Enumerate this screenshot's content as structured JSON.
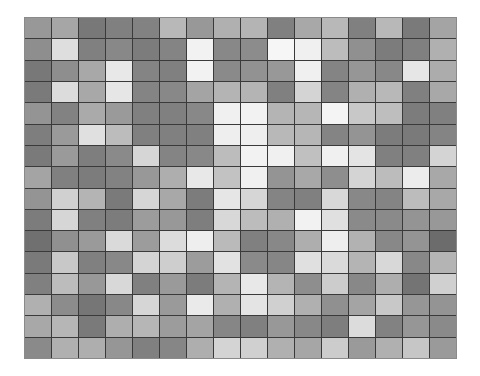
{
  "image": {
    "description": "grid of grayscale square tiles",
    "rows": 16,
    "cols": 16,
    "background": "#ffffff",
    "grout_color": "#3a3a3a",
    "tiles": [
      [
        "#989898",
        "#a6a6a6",
        "#787878",
        "#808080",
        "#828282",
        "#b8b8b8",
        "#989898",
        "#b0b0b0",
        "#b4b4b4",
        "#808080",
        "#a8a8a8",
        "#b8b8b8",
        "#808080",
        "#b8b8b8",
        "#7a7a7a",
        "#a4a4a4"
      ],
      [
        "#8e8e8e",
        "#dedede",
        "#808080",
        "#888888",
        "#7c7c7c",
        "#848484",
        "#f2f2f2",
        "#888888",
        "#8c8c8c",
        "#f6f6f6",
        "#f0f0f0",
        "#bcbcbc",
        "#909090",
        "#7c7c7c",
        "#808080",
        "#b0b0b0"
      ],
      [
        "#787878",
        "#8e8e8e",
        "#a8a8a8",
        "#e8e8e8",
        "#848484",
        "#808080",
        "#f2f2f2",
        "#8a8a8a",
        "#929292",
        "#989898",
        "#f0f0f0",
        "#848484",
        "#969696",
        "#888888",
        "#e6e6e6",
        "#acacac"
      ],
      [
        "#7a7a7a",
        "#dcdcdc",
        "#a8a8a8",
        "#e6e6e6",
        "#848484",
        "#888888",
        "#a4a4a4",
        "#b4b4b4",
        "#b4b4b4",
        "#808080",
        "#d4d4d4",
        "#848484",
        "#b0b0b0",
        "#b8b8b8",
        "#808080",
        "#a8a8a8"
      ],
      [
        "#949494",
        "#828282",
        "#aaaaaa",
        "#9a9a9a",
        "#808080",
        "#808080",
        "#888888",
        "#f0f0f0",
        "#f2f2f2",
        "#b4b4b4",
        "#b6b6b6",
        "#f4f4f4",
        "#c8c8c8",
        "#bebebe",
        "#7c7c7c",
        "#808080"
      ],
      [
        "#7e7e7e",
        "#9a9a9a",
        "#e0e0e0",
        "#bcbcbc",
        "#808080",
        "#808080",
        "#808080",
        "#eeeeee",
        "#eeeeee",
        "#b8b8b8",
        "#b6b6b6",
        "#848484",
        "#949494",
        "#7c7c7c",
        "#7a7a7a",
        "#848484"
      ],
      [
        "#7a7a7a",
        "#9a9a9a",
        "#7e7e7e",
        "#8a8a8a",
        "#d6d6d6",
        "#848484",
        "#888888",
        "#bcbcbc",
        "#f2f2f2",
        "#f0f0f0",
        "#c0c0c0",
        "#f0f0f0",
        "#e4e4e4",
        "#808080",
        "#808080",
        "#d4d4d4"
      ],
      [
        "#a4a4a4",
        "#808080",
        "#7c7c7c",
        "#828282",
        "#989898",
        "#aeaeae",
        "#e8e8e8",
        "#c2c2c2",
        "#f0f0f0",
        "#949494",
        "#a8a8a8",
        "#8e8e8e",
        "#d4d4d4",
        "#bcbcbc",
        "#ececec",
        "#a8a8a8"
      ],
      [
        "#949494",
        "#d0d0d0",
        "#b4b4b4",
        "#7a7a7a",
        "#d6d6d6",
        "#a8a8a8",
        "#7c7c7c",
        "#e6e6e6",
        "#d6d6d6",
        "#848484",
        "#808080",
        "#d8d8d8",
        "#888888",
        "#848484",
        "#bcbcbc",
        "#a8a8a8"
      ],
      [
        "#7c7c7c",
        "#d6d6d6",
        "#808080",
        "#7c7c7c",
        "#9c9c9c",
        "#989898",
        "#7e7e7e",
        "#d8d8d8",
        "#bcbcbc",
        "#b0b0b0",
        "#f2f2f2",
        "#e0e0e0",
        "#8a8a8a",
        "#8a8a8a",
        "#949494",
        "#989898"
      ],
      [
        "#707070",
        "#909090",
        "#9a9a9a",
        "#dadada",
        "#9c9c9c",
        "#dcdcdc",
        "#eeeeee",
        "#bababa",
        "#808080",
        "#888888",
        "#aeaeae",
        "#eeeeee",
        "#b2b2b2",
        "#888888",
        "#949494",
        "#6c6c6c"
      ],
      [
        "#7a7a7a",
        "#c8c8c8",
        "#808080",
        "#888888",
        "#d4d4d4",
        "#cecece",
        "#9c9c9c",
        "#e2e2e2",
        "#8a8a8a",
        "#868686",
        "#e0e0e0",
        "#dadada",
        "#b4b4b4",
        "#d8d8d8",
        "#888888",
        "#b4b4b4"
      ],
      [
        "#808080",
        "#bcbcbc",
        "#989898",
        "#d8d8d8",
        "#808080",
        "#9a9a9a",
        "#7c7c7c",
        "#b4b4b4",
        "#e8e8e8",
        "#b4b4b4",
        "#8e8e8e",
        "#cccccc",
        "#888888",
        "#aeaeae",
        "#747474",
        "#d0d0d0"
      ],
      [
        "#b0b0b0",
        "#8c8c8c",
        "#767676",
        "#888888",
        "#d6d6d6",
        "#9a9a9a",
        "#eaeaea",
        "#b0b0b0",
        "#e4e4e4",
        "#d0d0d0",
        "#b0b0b0",
        "#909090",
        "#a4a4a4",
        "#c8c8c8",
        "#969696",
        "#949494"
      ],
      [
        "#a8a8a8",
        "#b6b6b6",
        "#7a7a7a",
        "#aeaeae",
        "#b6b6b6",
        "#9c9c9c",
        "#a4a4a4",
        "#868686",
        "#808080",
        "#989898",
        "#888888",
        "#7e7e7e",
        "#dcdcdc",
        "#828282",
        "#969696",
        "#8a8a8a"
      ],
      [
        "#8a8a8a",
        "#b0b0b0",
        "#aeaeae",
        "#969696",
        "#808080",
        "#868686",
        "#aeaeae",
        "#d4d4d4",
        "#d0d0d0",
        "#b0b0b0",
        "#a6a6a6",
        "#cccccc",
        "#9a9a9a",
        "#b0b0b0",
        "#c6c6c6",
        "#9a9a9a"
      ]
    ]
  }
}
